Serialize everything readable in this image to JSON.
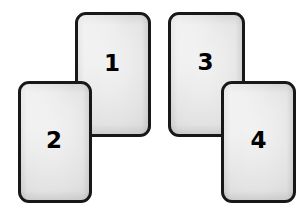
{
  "scene": {
    "background_color": "#ffffff",
    "width": 308,
    "height": 216,
    "description": "Four numbered rounded rectangular cards arranged in two overlapping pairs"
  },
  "style": {
    "border_color": "#16181a",
    "card_fill_light": "#f2f2f2",
    "card_fill_dark": "#cfcfcf",
    "number_color": "#000000"
  },
  "cards": [
    {
      "id": "card-1",
      "label": "1",
      "left": 75,
      "top": 12,
      "width": 76,
      "height": 125,
      "stack_order": "back",
      "group": "left-pair"
    },
    {
      "id": "card-2",
      "label": "2",
      "left": 18,
      "top": 81,
      "width": 74,
      "height": 122,
      "stack_order": "front",
      "group": "left-pair"
    },
    {
      "id": "card-3",
      "label": "3",
      "left": 168,
      "top": 12,
      "width": 77,
      "height": 125,
      "stack_order": "back",
      "group": "right-pair"
    },
    {
      "id": "card-4",
      "label": "4",
      "left": 221,
      "top": 81,
      "width": 75,
      "height": 122,
      "stack_order": "front",
      "group": "right-pair"
    }
  ]
}
